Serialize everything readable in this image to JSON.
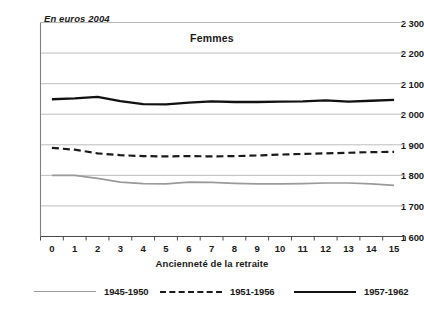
{
  "chart_data": {
    "type": "line",
    "title": "Femmes",
    "subtitle": "En euros 2004",
    "xlabel": "Ancienneté de la retraite",
    "ylabel": "En euros 2004",
    "grid": true,
    "legend_position": "bottom",
    "xlim": [
      0,
      15
    ],
    "ylim": [
      1600,
      2300
    ],
    "ytick_step": 100,
    "x": [
      0,
      1,
      2,
      3,
      4,
      5,
      6,
      7,
      8,
      9,
      10,
      11,
      12,
      13,
      14,
      15
    ],
    "categories": [
      "0",
      "1",
      "2",
      "3",
      "4",
      "5",
      "6",
      "7",
      "8",
      "9",
      "10",
      "11",
      "12",
      "13",
      "14",
      "15"
    ],
    "ytick_labels": [
      "2 300",
      "2 200",
      "2 100",
      "2 000",
      "1 900",
      "1 800",
      "1 700",
      "1 600"
    ],
    "ytick_values": [
      2300,
      2200,
      2100,
      2000,
      1900,
      1800,
      1700,
      1600
    ],
    "series": [
      {
        "name": "1945-1950",
        "color": "#9a9a9a",
        "style": "solid-thin",
        "values": [
          1800,
          1800,
          1790,
          1778,
          1773,
          1772,
          1778,
          1777,
          1774,
          1772,
          1772,
          1773,
          1775,
          1775,
          1772,
          1767
        ]
      },
      {
        "name": "1951-1956",
        "color": "#1a1a1a",
        "style": "dashed",
        "values": [
          1890,
          1884,
          1872,
          1866,
          1863,
          1862,
          1863,
          1862,
          1863,
          1865,
          1868,
          1870,
          1872,
          1874,
          1876,
          1877
        ]
      },
      {
        "name": "1957-1962",
        "color": "#111111",
        "style": "solid-thick",
        "values": [
          2049,
          2052,
          2057,
          2043,
          2033,
          2032,
          2038,
          2042,
          2040,
          2040,
          2041,
          2042,
          2045,
          2041,
          2044,
          2047
        ]
      }
    ]
  },
  "chart": {
    "title": "Femmes",
    "unit_note": "En euros 2004",
    "xaxis_title": "Ancienneté de la retraite"
  },
  "legend": {
    "items": [
      {
        "label": "1945-1950",
        "swatch": "thin-gray-line-icon"
      },
      {
        "label": "1951-1956",
        "swatch": "dashed-black-line-icon"
      },
      {
        "label": "1957-1962",
        "swatch": "thick-black-line-icon"
      }
    ]
  }
}
